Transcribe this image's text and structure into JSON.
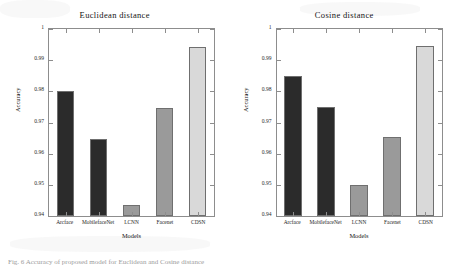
{
  "figure": {
    "caption": "Fig. 6  Accuracy of proposed model for Euclidean and Cosine distance",
    "background": "#ffffff"
  },
  "colors": {
    "bar_dark": "#2b2b2b",
    "bar_medium": "#9a9a9a",
    "bar_light": "#d9d9d9",
    "axis": "#8d8d8d",
    "text": "#141414"
  },
  "chart_data": [
    {
      "type": "bar",
      "title": "Euclidean distance",
      "xlabel": "Models",
      "ylabel": "Accuracy",
      "categories": [
        "Arcface",
        "MobilefaceNet",
        "LCNN",
        "Facenet",
        "CDSN"
      ],
      "values": [
        0.98,
        0.9648,
        0.9435,
        0.9745,
        0.9943
      ],
      "ylim": [
        0.94,
        1
      ],
      "yticks": [
        "0.94",
        "0.95",
        "0.96",
        "0.97",
        "0.98",
        "0.99",
        "1"
      ],
      "ytick_values": [
        0.94,
        0.95,
        0.96,
        0.97,
        0.98,
        0.99,
        1
      ],
      "bar_colors": [
        "#2b2b2b",
        "#2b2b2b",
        "#9a9a9a",
        "#9a9a9a",
        "#d9d9d9"
      ],
      "grid": false,
      "legend": "none"
    },
    {
      "type": "bar",
      "title": "Cosine distance",
      "xlabel": "Models",
      "ylabel": "Accuracy",
      "categories": [
        "Arcface",
        "MobilefaceNet",
        "LCNN",
        "Facenet",
        "CDSN"
      ],
      "values": [
        0.985,
        0.975,
        0.9499,
        0.9653,
        0.9947
      ],
      "ylim": [
        0.94,
        1
      ],
      "yticks": [
        "0.94",
        "0.95",
        "0.96",
        "0.97",
        "0.98",
        "0.99",
        "1"
      ],
      "ytick_values": [
        0.94,
        0.95,
        0.96,
        0.97,
        0.98,
        0.99,
        1
      ],
      "bar_colors": [
        "#2b2b2b",
        "#2b2b2b",
        "#9a9a9a",
        "#9a9a9a",
        "#d9d9d9"
      ],
      "grid": false,
      "legend": "none"
    }
  ]
}
